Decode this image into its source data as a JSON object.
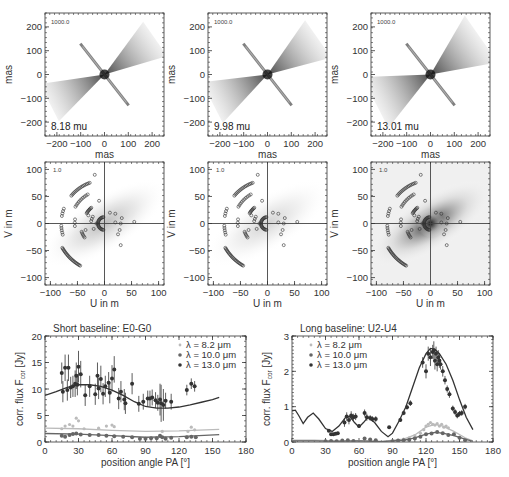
{
  "image_panels": [
    {
      "label": "8.18 mu",
      "scale_label": "1000.0",
      "xlabel": "mas",
      "ylabel": "mas"
    },
    {
      "label": "9.98 mu",
      "scale_label": "1000.0",
      "xlabel": "mas",
      "ylabel": "mas"
    },
    {
      "label": "13.01 mu",
      "scale_label": "1000.0",
      "xlabel": "mas",
      "ylabel": "mas"
    }
  ],
  "image_axes": {
    "xticks": [
      "-200",
      "-100",
      "0",
      "100",
      "200"
    ],
    "yticks": [
      "200",
      "100",
      "0",
      "-100",
      "-200"
    ]
  },
  "uv_panels": [
    {
      "scale_label": "1.0",
      "xlabel": "U in m",
      "ylabel": "V in m"
    },
    {
      "scale_label": "1.0",
      "xlabel": "U in m",
      "ylabel": "V in m"
    },
    {
      "scale_label": "1.0",
      "xlabel": "U in m",
      "ylabel": "V in m"
    }
  ],
  "uv_axes": {
    "xticks": [
      "-100",
      "-50",
      "0",
      "50",
      "100"
    ],
    "yticks": [
      "100",
      "50",
      "0",
      "-50",
      "-100"
    ]
  },
  "chart_data": [
    {
      "type": "scatter",
      "title": "Short baseline: E0-G0",
      "xlabel": "position angle PA [°]",
      "ylabel": "corr. flux F_cor [Jy]",
      "ylabel_main": "corr. flux F",
      "ylabel_sub": "cor",
      "ylabel_unit": " [Jy]",
      "xlim": [
        0,
        180
      ],
      "ylim": [
        0,
        20
      ],
      "xticks": [
        "0",
        "30",
        "60",
        "90",
        "120",
        "150",
        "180"
      ],
      "yticks": [
        "0",
        "5",
        "10",
        "15",
        "20"
      ],
      "legend": [
        "λ =  8.2 μm",
        "λ = 10.0 μm",
        "λ = 13.0 μm"
      ],
      "legend_position": "upper right",
      "series": [
        {
          "name": "λ = 8.2 μm",
          "color": "#bbbbbb",
          "x": [
            15,
            18,
            22,
            25,
            28,
            30,
            35,
            48,
            55,
            60,
            62,
            105,
            128,
            131,
            134
          ],
          "y": [
            2.5,
            3.0,
            3.3,
            3.0,
            4.5,
            4.0,
            2.5,
            2.6,
            3.0,
            3.2,
            2.9,
            2.0,
            2.0,
            2.8,
            2.3
          ],
          "model_x": [
            0,
            30,
            60,
            90,
            120,
            156
          ],
          "model_y": [
            2.6,
            2.5,
            2.2,
            2.0,
            2.1,
            2.4
          ]
        },
        {
          "name": "λ = 10.0 μm",
          "color": "#666666",
          "x": [
            15,
            18,
            22,
            25,
            28,
            32,
            40,
            48,
            55,
            62,
            70,
            78,
            85,
            90,
            95,
            100,
            103,
            105,
            108,
            113,
            127,
            131,
            135
          ],
          "y": [
            1.2,
            1.0,
            1.3,
            1.5,
            1.6,
            1.4,
            1.3,
            1.3,
            1.2,
            1.1,
            1.0,
            0.9,
            0.6,
            0.6,
            0.7,
            0.7,
            1.2,
            0.9,
            0.6,
            0.8,
            0.9,
            1.0,
            0.9
          ],
          "model_x": [
            0,
            30,
            60,
            90,
            120,
            156
          ],
          "model_y": [
            1.6,
            1.5,
            1.2,
            0.9,
            1.0,
            1.4
          ]
        },
        {
          "name": "λ = 13.0 μm",
          "color": "#333333",
          "x": [
            15,
            16,
            18,
            20,
            21,
            23,
            25,
            27,
            28,
            29,
            30,
            32,
            36,
            40,
            45,
            47,
            48,
            50,
            52,
            54,
            57,
            58,
            60,
            62,
            66,
            68,
            71,
            72,
            78,
            84,
            88,
            92,
            94,
            96,
            99,
            101,
            103,
            104,
            106,
            108,
            113,
            127,
            131,
            134
          ],
          "y": [
            13.0,
            9.5,
            14.0,
            9.8,
            14.0,
            10.3,
            10.5,
            11.0,
            12.5,
            10.8,
            14.2,
            12.8,
            8.8,
            10.5,
            9.0,
            12.5,
            10.1,
            11.9,
            9.1,
            10.5,
            11.2,
            9.3,
            12.0,
            13.7,
            8.2,
            9.5,
            8.0,
            7.3,
            11.0,
            7.2,
            7.6,
            8.2,
            8.2,
            8.4,
            7.9,
            7.4,
            8.0,
            7.3,
            7.0,
            7.8,
            7.6,
            9.8,
            11.0,
            10.5
          ],
          "yerr": [
            2.0,
            2.0,
            2.5,
            2.0,
            2.5,
            2.0,
            2.0,
            2.5,
            2.5,
            2.0,
            3.0,
            2.5,
            2.0,
            2.0,
            2.0,
            2.5,
            2.0,
            2.5,
            2.0,
            2.0,
            2.0,
            2.0,
            2.5,
            2.5,
            2.0,
            2.0,
            2.0,
            2.0,
            2.0,
            1.5,
            1.5,
            1.5,
            1.5,
            1.5,
            1.5,
            1.5,
            3.0,
            3.5,
            3.0,
            1.5,
            1.5,
            1.0,
            1.0,
            1.0
          ],
          "model_x": [
            0,
            10,
            20,
            30,
            40,
            50,
            60,
            70,
            80,
            90,
            100,
            110,
            120,
            130,
            140,
            150,
            156
          ],
          "model_y": [
            8.8,
            9.5,
            10.3,
            10.8,
            10.8,
            10.5,
            9.8,
            8.8,
            7.6,
            6.7,
            6.4,
            6.4,
            6.6,
            7.0,
            7.5,
            8.0,
            8.4
          ]
        }
      ]
    },
    {
      "type": "scatter",
      "title": "Long  baseline: U2-U4",
      "xlabel": "position angle PA [°]",
      "ylabel": "corr. flux F_cor [Jy]",
      "ylabel_main": "corr. flux F",
      "ylabel_sub": "cor",
      "ylabel_unit": " [Jy]",
      "xlim": [
        0,
        180
      ],
      "ylim": [
        0,
        3
      ],
      "xticks": [
        "0",
        "30",
        "60",
        "90",
        "120",
        "150",
        "180"
      ],
      "yticks": [
        "0",
        "1",
        "2",
        "3"
      ],
      "legend": [
        "λ =  8.2 μm",
        "λ = 10.0 μm",
        "λ = 13.0 μm"
      ],
      "legend_position": "upper left",
      "series": [
        {
          "name": "λ = 8.2 μm",
          "color": "#bbbbbb",
          "x": [
            95,
            100,
            105,
            110,
            115,
            118,
            120,
            122,
            124,
            126,
            128,
            130,
            132,
            134,
            136,
            138,
            140
          ],
          "y": [
            0.05,
            0.08,
            0.12,
            0.18,
            0.25,
            0.35,
            0.45,
            0.5,
            0.55,
            0.5,
            0.48,
            0.52,
            0.45,
            0.5,
            0.42,
            0.45,
            0.4
          ],
          "model_x": [
            0,
            20,
            40,
            60,
            80,
            100,
            110,
            120,
            128,
            135,
            145,
            155,
            162
          ],
          "model_y": [
            0.05,
            0.05,
            0.03,
            0.04,
            0.02,
            0.08,
            0.2,
            0.42,
            0.5,
            0.45,
            0.3,
            0.12,
            0.03
          ]
        },
        {
          "name": "λ = 10.0 μm",
          "color": "#666666",
          "x": [
            30,
            35,
            40,
            45,
            50,
            55,
            65,
            70,
            75,
            90,
            95,
            100,
            105,
            110,
            115,
            120,
            125,
            130,
            135,
            140,
            145,
            150,
            155
          ],
          "y": [
            0.02,
            0.03,
            0.02,
            0.04,
            0.05,
            0.03,
            0.1,
            0.07,
            0.05,
            0.02,
            0.04,
            0.05,
            0.06,
            0.1,
            0.15,
            0.22,
            0.24,
            0.28,
            0.25,
            0.2,
            0.22,
            0.12,
            0.05
          ],
          "model_x": [
            0,
            20,
            40,
            60,
            80,
            100,
            110,
            120,
            128,
            135,
            145,
            155,
            162
          ],
          "model_y": [
            0.03,
            0.03,
            0.02,
            0.03,
            0.01,
            0.05,
            0.12,
            0.22,
            0.27,
            0.25,
            0.18,
            0.08,
            0.02
          ]
        },
        {
          "name": "λ = 13.0 μm",
          "color": "#333333",
          "x": [
            33,
            35,
            37,
            39,
            41,
            47,
            49,
            51,
            53,
            55,
            57,
            60,
            65,
            67,
            70,
            72,
            75,
            87,
            97,
            100,
            103,
            106,
            117,
            120,
            122,
            124,
            126,
            127,
            128,
            129,
            130,
            131,
            132,
            133,
            135,
            137,
            139,
            141,
            144,
            146,
            148,
            150,
            152,
            155
          ],
          "y": [
            0.32,
            0.22,
            0.22,
            0.23,
            0.25,
            0.55,
            0.72,
            0.62,
            0.75,
            0.7,
            0.72,
            0.45,
            0.82,
            0.7,
            0.68,
            0.65,
            0.65,
            0.42,
            0.62,
            0.82,
            0.98,
            1.1,
            2.25,
            2.0,
            2.5,
            2.4,
            2.55,
            2.6,
            2.3,
            2.5,
            2.2,
            2.4,
            2.3,
            2.2,
            2.0,
            1.75,
            1.5,
            1.35,
            0.95,
            0.85,
            0.75,
            0.8,
            0.82,
            1.0
          ],
          "yerr": [
            0,
            0,
            0,
            0,
            0,
            0.12,
            0.12,
            0.12,
            0.12,
            0.1,
            0.1,
            0.05,
            0.1,
            0.1,
            0.08,
            0.08,
            0.08,
            0,
            0.05,
            0.06,
            0.06,
            0.08,
            0.15,
            0.2,
            0.2,
            0.25,
            0.2,
            0.25,
            0.25,
            0.2,
            0.2,
            0.2,
            0.2,
            0.15,
            0.15,
            0.12,
            0.1,
            0.1,
            0.08,
            0.08,
            0.08,
            0.08,
            0.08,
            0.08
          ],
          "model_x": [
            0,
            3,
            6,
            10,
            14,
            19,
            24,
            30,
            36,
            42,
            48,
            52,
            56,
            60,
            64,
            68,
            74,
            80,
            86,
            90,
            96,
            102,
            108,
            114,
            120,
            124,
            128,
            132,
            138,
            144,
            150,
            156,
            162
          ],
          "model_y": [
            0.88,
            0.9,
            0.75,
            0.52,
            0.7,
            0.82,
            0.65,
            0.38,
            0.3,
            0.45,
            0.7,
            0.72,
            0.55,
            0.42,
            0.55,
            0.7,
            0.55,
            0.3,
            0.15,
            0.25,
            0.6,
            1.0,
            1.55,
            2.1,
            2.5,
            2.65,
            2.62,
            2.5,
            2.2,
            1.75,
            1.2,
            0.7,
            0.35
          ]
        }
      ]
    }
  ]
}
